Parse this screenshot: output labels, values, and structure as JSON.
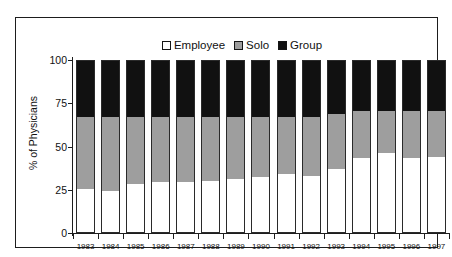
{
  "top_fragment": "",
  "axes": {
    "ylabel": "% of Physicians",
    "yticks": [
      "0",
      "25",
      "50",
      "75",
      "100"
    ]
  },
  "legend": {
    "items": [
      {
        "label": "Employee",
        "swatch": "white-square-icon",
        "color": "#ffffff"
      },
      {
        "label": "Solo",
        "swatch": "gray-square-icon",
        "color": "#9e9e9e"
      },
      {
        "label": "Group",
        "swatch": "black-square-icon",
        "color": "#111111"
      }
    ]
  },
  "chart_data": {
    "type": "bar",
    "stacked": true,
    "stack_total": 100,
    "title": "",
    "subtitle": "",
    "xlabel": "",
    "ylabel": "% of Physicians",
    "ylim": [
      0,
      100
    ],
    "yticks": [
      0,
      25,
      50,
      75,
      100
    ],
    "grid": false,
    "legend_position": "top-center",
    "categories": [
      "1983",
      "1984",
      "1985",
      "1986",
      "1987",
      "1988",
      "1989",
      "1990",
      "1991",
      "1992",
      "1993",
      "1994",
      "1995",
      "1996",
      "1997"
    ],
    "series": [
      {
        "name": "Employee",
        "color": "#ffffff",
        "values": [
          25,
          24,
          28,
          29,
          29,
          30,
          31,
          32,
          34,
          33,
          37,
          43,
          46,
          43,
          44
        ]
      },
      {
        "name": "Solo",
        "color": "#9e9e9e",
        "values": [
          42,
          43,
          39,
          38,
          38,
          37,
          36,
          35,
          33,
          34,
          32,
          28,
          25,
          28,
          27
        ]
      },
      {
        "name": "Group",
        "color": "#111111",
        "values": [
          33,
          33,
          33,
          33,
          33,
          33,
          33,
          33,
          33,
          33,
          31,
          29,
          29,
          29,
          29
        ]
      }
    ]
  }
}
